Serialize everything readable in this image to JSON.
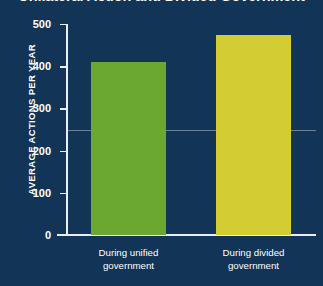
{
  "chart_data": {
    "type": "bar",
    "title": "Unilateral Action and Divided Government",
    "xlabel": "",
    "ylabel": "AVERAGE ACTIONS PER YEAR",
    "categories": [
      "During unified government",
      "During divided government"
    ],
    "category_lines": [
      [
        "During unified",
        "government"
      ],
      [
        "During divided",
        "government"
      ]
    ],
    "values": [
      410,
      475
    ],
    "ylim": [
      0,
      500
    ],
    "yticks": [
      500,
      400,
      300,
      200,
      100,
      0
    ],
    "grid": false,
    "legend": "none",
    "reference_line": 250,
    "bar_colors": [
      "#6ba832",
      "#d4cc33"
    ],
    "background_color": "#123457",
    "axis_color": "#e9eef2",
    "text_color": "#ffffff"
  }
}
